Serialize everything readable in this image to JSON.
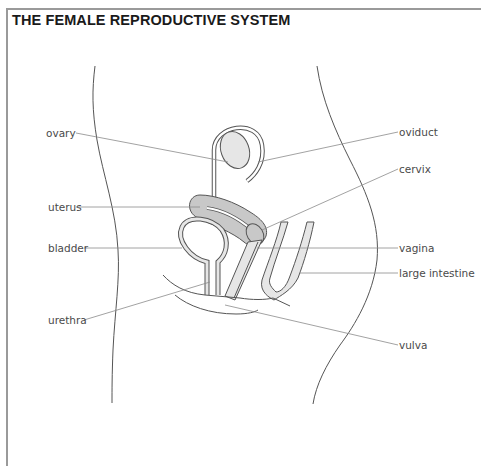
{
  "title": "THE FEMALE REPRODUCTIVE SYSTEM",
  "colors": {
    "organ_fill": "#c8c8c8",
    "organ_light_fill": "#e6e6e6",
    "line": "#555555",
    "leader": "#8a8a8a",
    "frame": "#9a9a9a",
    "text": "#4a4a4a"
  },
  "labels": {
    "left": [
      {
        "id": "ovary",
        "text": "ovary"
      },
      {
        "id": "uterus",
        "text": "uterus"
      },
      {
        "id": "bladder",
        "text": "bladder"
      },
      {
        "id": "urethra",
        "text": "urethra"
      }
    ],
    "right": [
      {
        "id": "oviduct",
        "text": "oviduct"
      },
      {
        "id": "cervix",
        "text": "cervix"
      },
      {
        "id": "vagina",
        "text": "vagina"
      },
      {
        "id": "large_intestine",
        "text": "large intestine"
      },
      {
        "id": "vulva",
        "text": "vulva"
      }
    ]
  }
}
